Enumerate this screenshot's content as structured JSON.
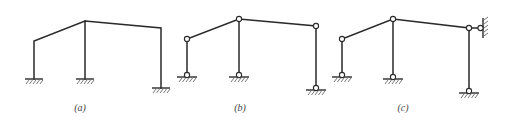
{
  "figure": {
    "panels": [
      {
        "label": "(a)",
        "support_type": "fixed",
        "joints": "rigid",
        "extra_support": null
      },
      {
        "label": "(b)",
        "support_type": "pinned",
        "joints": "hinged",
        "extra_support": null
      },
      {
        "label": "(c)",
        "support_type": "pinned",
        "joints": "hinged",
        "extra_support": "lateral pin to wall at right top"
      }
    ]
  },
  "colors": {
    "line": "#2a2a2a",
    "background": "#ffffff"
  }
}
